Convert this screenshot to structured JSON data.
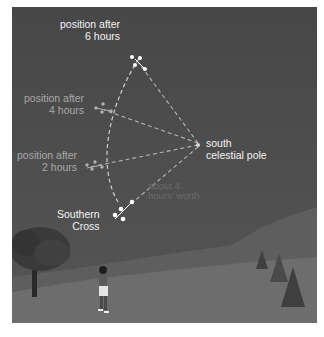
{
  "diagram": {
    "labels": {
      "pos6": [
        "position after",
        "6 hours"
      ],
      "pos4": [
        "position after",
        "4 hours"
      ],
      "pos2": [
        "position after",
        "2 hours"
      ],
      "cross": [
        "Southern",
        "Cross"
      ],
      "pole": [
        "south",
        "celestial pole"
      ],
      "angle": [
        "about 4",
        "hours' worth"
      ]
    },
    "scene": {
      "observer": "person looking up at night sky",
      "left": "leafy tree",
      "right": "hills with conifer trees"
    },
    "colors": {
      "sky": "#4a4a4a",
      "ground": "#6e6e6e",
      "hills": "#5a5a5a",
      "label_bright": "#f2f2f2",
      "label_mid": "#a8a8a8",
      "dashes": "#bdbdbd"
    }
  }
}
